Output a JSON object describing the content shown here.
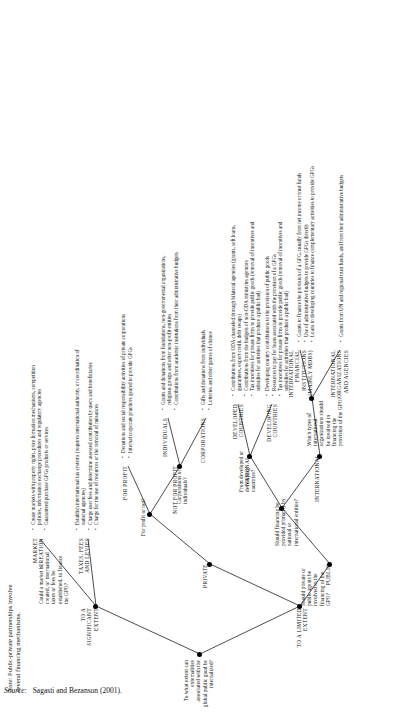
{
  "diagram": {
    "root_question": "To what extent can externalities associated with the global public good be internalized?",
    "branches": {
      "to_a_limited_extent": "TO A LIMITED EXTENT",
      "to_a_significant_extent": "TO A SIGNIFICANT EXTENT"
    },
    "questions": {
      "private_public": "Should private or public agents be involved in the financing of the GPO?",
      "market": "Could a market be created, or international taxes or fees be established, to finance the GPO?",
      "for_profit": "For profit or not?",
      "corporations_individuals": "Corporations or individuals?",
      "national_international": "Should financing be provided primarily by national or international entities?",
      "developed_developing": "From developed or developing countries?",
      "ifi_or_un": "Which types of international organizations should be involved in financing the provision of the GPO?"
    },
    "categories": {
      "private": "PRIVATE",
      "public": "PUBLIC",
      "market_creation": "MARKET CREATION",
      "taxes_fees_levies": "TAXES, FEES AND LEVIES",
      "for_profit": "FOR PROFIT",
      "not_for_profit": "NOT FOR PROFIT",
      "individuals": "INDIVIDUALS",
      "corporations": "CORPORATIONS",
      "national": "NATIONAL",
      "international": "INTERNATIONAL",
      "developed_countries": "DEVELOPED COUNTRIES",
      "developing_countries": "DEVELOPING COUNTRIES",
      "ifis": "INTERNATIONAL FINANCIAL INSTITUTIONS (mainly MDBs)",
      "un_orgs": "INTERNATIONAL ORGANIZATIONS AND AGENCIES"
    },
    "bullet_groups": {
      "market_creation": [
        "Create markets with property rights, price formation mechanisms, competition policies, information exchange procedures and regulatory agencies",
        "Guaranteed purchase GPGs products or services"
      ],
      "taxes_fees_levies": [
        "Establish international tax systems (requires international authority, or coordination of national agencies)",
        "Charge user fees and determine assessed contribution by users and beneficiaries",
        "Charge for the use of resources or the removal of nuisances"
      ],
      "for_profit": [
        "Donations and social responsibility activities of private corporations",
        "Internal corporate practices geared to provide GPGs"
      ],
      "not_for_profit": [
        "Grants and donations from foundations, non-governmental organizations, religious groups and other non-profit entities",
        "Contributions from academic institutions from their administrative budgets"
      ],
      "individuals": [
        "Gifts and donations from individuals",
        "Lotteries and other games of chance"
      ],
      "developed_countries": [
        "Contributions from ODA channeled through bilateral agencies (grants, soft loans, guarantees, export credit, debt swaps)",
        "Contributions from the budgets of non-ODA ministries agencies",
        "Tax incentives for private firms to provide public goods (removal of incentives and subsidies for activities that produce a public bad)"
      ],
      "developing_countries": [
        "Developing country contributions to the provision of public goods",
        "Resources to pay for loans associated with the provision of a GPGs",
        "Tax incentives for private firms to provide public goods (removal of incentives and subsidies for activities that produce a public bad)"
      ],
      "ifis": [
        "Grants to finance the provision of a GPG, usually from net income or trust funds",
        "Use of administrative budgets to provide GPGs directly",
        "Loans to developing countries to finance complementary activities to provide GPGs"
      ],
      "un_orgs": [
        "Grants from UN and regional trust funds, and from their administrative budgets"
      ]
    }
  },
  "footnotes": {
    "note_label": "Note:",
    "note_text": "Public-private partnerships involve several financing mechanisms.",
    "source_label": "Source:",
    "source_text": "Sagasti and Bezanson (2001)."
  }
}
